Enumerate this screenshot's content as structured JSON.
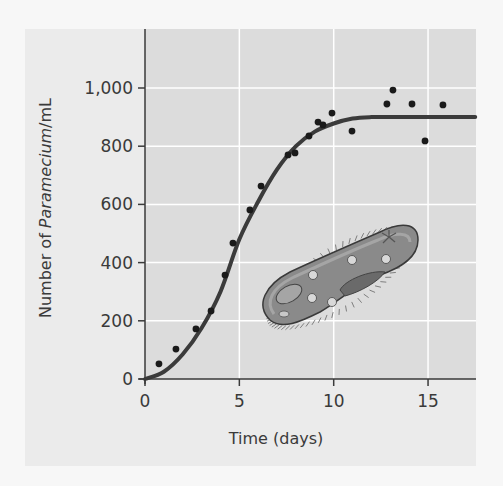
{
  "chart_data": {
    "type": "scatter",
    "title": "",
    "xlabel": "Time (days)",
    "ylabel_parts": [
      "Number of ",
      "Paramecium",
      "/mL"
    ],
    "ylabel": "Number of Paramecium/mL",
    "xlim": [
      0,
      17.5
    ],
    "ylim": [
      0,
      1150
    ],
    "xticks": [
      0,
      5,
      10,
      15
    ],
    "xtick_labels": [
      "0",
      "5",
      "10",
      "15"
    ],
    "yticks": [
      0,
      200,
      400,
      600,
      800,
      1000
    ],
    "ytick_labels": [
      "0",
      "200",
      "400",
      "600",
      "800",
      "1,000"
    ],
    "grid": true,
    "legend": null,
    "series": [
      {
        "name": "Observed population",
        "kind": "scatter",
        "x": [
          0.74,
          1.64,
          2.7,
          3.5,
          4.24,
          4.66,
          5.56,
          6.15,
          7.58,
          7.95,
          8.69,
          9.17,
          9.43,
          9.91,
          10.97,
          12.82,
          13.14,
          14.15,
          14.84,
          15.79
        ],
        "y": [
          52,
          103,
          172,
          234,
          357,
          467,
          581,
          663,
          770,
          777,
          835,
          883,
          873,
          914,
          852,
          945,
          993,
          945,
          818,
          942
        ]
      },
      {
        "name": "Logistic growth curve",
        "kind": "line",
        "carrying_capacity": 900,
        "x": [
          0,
          1,
          2,
          3,
          4,
          5,
          6,
          7,
          8,
          9,
          10,
          11,
          12,
          13,
          14,
          15,
          16,
          17.5
        ],
        "y": [
          0,
          25,
          85,
          175,
          300,
          480,
          610,
          720,
          800,
          850,
          878,
          895,
          900,
          900,
          900,
          900,
          900,
          900
        ]
      }
    ],
    "annotations": [
      "Illustration of a Paramecium (ciliated protist) inside the plot area"
    ]
  },
  "colors": {
    "page_background": "#f7f7f7",
    "panel_background": "#ebebeb",
    "plot_background": "#dcdcdc",
    "grid": "#ffffff",
    "curve": "#3b3b3b",
    "points": "#1a1a1a",
    "text": "#3a3a3a"
  }
}
